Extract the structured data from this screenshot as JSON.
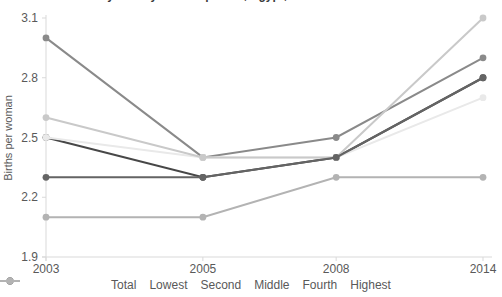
{
  "title": "Total desired family size by wealth quintile, Egypt, 2003-14",
  "chart_data": {
    "type": "line",
    "categories": [
      "2003",
      "2005",
      "2008",
      "2014"
    ],
    "series": [
      {
        "name": "Total",
        "color": "#474747",
        "values": [
          2.5,
          2.3,
          2.4,
          2.8
        ]
      },
      {
        "name": "Lowest",
        "color": "#8a8a8a",
        "values": [
          3.0,
          2.4,
          2.5,
          2.9
        ]
      },
      {
        "name": "Second",
        "color": "#e9e9e9",
        "values": [
          2.5,
          2.4,
          2.4,
          2.7
        ]
      },
      {
        "name": "Middle",
        "color": "#c9c9c9",
        "values": [
          2.6,
          2.4,
          2.4,
          3.1
        ]
      },
      {
        "name": "Fourth",
        "color": "#646464",
        "values": [
          2.3,
          2.3,
          2.4,
          2.8
        ]
      },
      {
        "name": "Highest",
        "color": "#b3b3b3",
        "values": [
          2.1,
          2.1,
          2.3,
          2.3
        ]
      }
    ],
    "ylabel": "Births per woman",
    "xlabel": "",
    "yticks": [
      3.1,
      2.8,
      2.5,
      2.2,
      1.9
    ],
    "ylim": [
      1.9,
      3.1
    ],
    "grid": false,
    "legend_position": "bottom",
    "axis_color": "#d9d9d9",
    "text_color": "#595959"
  }
}
